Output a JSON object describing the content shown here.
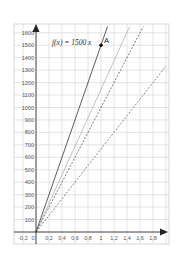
{
  "chart_data": {
    "type": "line",
    "title": "",
    "xlabel": "",
    "ylabel": "",
    "xlim": [
      -0.3,
      2.0
    ],
    "ylim": [
      0,
      1650
    ],
    "grid": true,
    "x_ticks": [
      -0.2,
      0,
      0.2,
      0.4,
      0.6,
      0.8,
      1,
      1.2,
      1.4,
      1.6,
      1.8
    ],
    "x_tick_labels": [
      "-0,2",
      "0",
      "0,2",
      "0,4",
      "0,6",
      "0,8",
      "1",
      "1,2",
      "1,4",
      "1,6",
      "1,8"
    ],
    "y_ticks": [
      100,
      200,
      300,
      400,
      500,
      600,
      700,
      800,
      900,
      1000,
      1100,
      1200,
      1300,
      1400,
      1500,
      1600
    ],
    "y_tick_labels": [
      "100",
      "200",
      "300",
      "400",
      "500",
      "600",
      "700",
      "800",
      "900",
      "1000",
      "1100",
      "1200",
      "1300",
      "1400",
      "1500",
      "1600"
    ],
    "series": [
      {
        "name": "f(x) = 1500 x",
        "style": "solid",
        "color": "#333333",
        "slope": 1500,
        "x": [
          0,
          1.1
        ],
        "values": [
          0,
          1650
        ]
      },
      {
        "name": "line 2",
        "style": "solid-light",
        "color": "#999999",
        "slope": 1143,
        "x": [
          0,
          1.44
        ],
        "values": [
          0,
          1650
        ]
      },
      {
        "name": "line 3",
        "style": "dashed",
        "color": "#444444",
        "slope": 1000,
        "x": [
          0,
          1.65
        ],
        "values": [
          0,
          1650
        ]
      },
      {
        "name": "line 4",
        "style": "dashed",
        "color": "#555555",
        "slope": 667,
        "x": [
          0,
          2.0
        ],
        "values": [
          0,
          1334
        ]
      }
    ],
    "points": [
      {
        "label": "A",
        "x": 1,
        "y": 1500
      }
    ],
    "annotations": [
      {
        "text": "f(x) = 1500 x",
        "x": 0.25,
        "y": 1500
      }
    ]
  },
  "labels": {
    "function": "f(x) = 1500 x",
    "point": "A"
  }
}
